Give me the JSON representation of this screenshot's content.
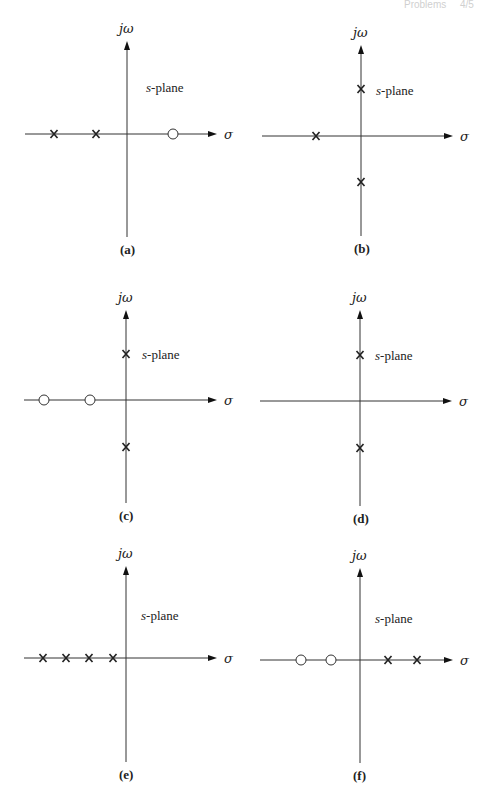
{
  "header": {
    "text": "Problems",
    "page": "4/5"
  },
  "axis_labels": {
    "imag": "jω",
    "real": "σ",
    "plane_italic": "s",
    "plane_rest": "-plane"
  },
  "panels": [
    {
      "id": "a",
      "label": "(a)",
      "origin": [
        127,
        134
      ],
      "hx": [
        25,
        217
      ],
      "vy": [
        41,
        237
      ],
      "plane_label_pos": [
        146,
        92
      ],
      "poles": [
        [
          54,
          134
        ],
        [
          96,
          134
        ]
      ],
      "zeros": [
        [
          173,
          134
        ]
      ]
    },
    {
      "id": "b",
      "label": "(b)",
      "origin": [
        361,
        136
      ],
      "hx": [
        262,
        453
      ],
      "vy": [
        45,
        236
      ],
      "plane_label_pos": [
        376,
        95
      ],
      "poles": [
        [
          361,
          89
        ],
        [
          316,
          136
        ],
        [
          361,
          182
        ]
      ],
      "zeros": []
    },
    {
      "id": "c",
      "label": "(c)",
      "origin": [
        126,
        400
      ],
      "hx": [
        24,
        217
      ],
      "vy": [
        310,
        503
      ],
      "plane_label_pos": [
        142,
        359
      ],
      "poles": [
        [
          126,
          354
        ],
        [
          126,
          447
        ]
      ],
      "zeros": [
        [
          44,
          400
        ],
        [
          90,
          400
        ]
      ]
    },
    {
      "id": "d",
      "label": "(d)",
      "origin": [
        360,
        401
      ],
      "hx": [
        260,
        452
      ],
      "vy": [
        310,
        506
      ],
      "plane_label_pos": [
        375,
        360
      ],
      "poles": [
        [
          360,
          355
        ],
        [
          360,
          448
        ]
      ],
      "zeros": []
    },
    {
      "id": "e",
      "label": "(e)",
      "origin": [
        126,
        658
      ],
      "hx": [
        24,
        217
      ],
      "vy": [
        566,
        762
      ],
      "plane_label_pos": [
        141,
        620
      ],
      "poles": [
        [
          43,
          658
        ],
        [
          66,
          658
        ],
        [
          89,
          658
        ],
        [
          113,
          658
        ]
      ],
      "zeros": []
    },
    {
      "id": "f",
      "label": "(f)",
      "origin": [
        360,
        660
      ],
      "hx": [
        260,
        453
      ],
      "vy": [
        568,
        763
      ],
      "plane_label_pos": [
        375,
        623
      ],
      "poles": [
        [
          388,
          660
        ],
        [
          417,
          660
        ]
      ],
      "zeros": [
        [
          301,
          660
        ],
        [
          331,
          660
        ]
      ]
    }
  ],
  "chart_data": [
    {
      "type": "scatter",
      "title": "(a)",
      "xlabel": "σ",
      "ylabel": "jω",
      "annotation": "s-plane",
      "poles": [
        {
          "re": -2,
          "im": 0
        },
        {
          "re": -1,
          "im": 0
        }
      ],
      "zeros": [
        {
          "re": 1,
          "im": 0
        }
      ]
    },
    {
      "type": "scatter",
      "title": "(b)",
      "xlabel": "σ",
      "ylabel": "jω",
      "annotation": "s-plane",
      "poles": [
        {
          "re": -1,
          "im": 0
        },
        {
          "re": 0,
          "im": 1
        },
        {
          "re": 0,
          "im": -1
        }
      ],
      "zeros": []
    },
    {
      "type": "scatter",
      "title": "(c)",
      "xlabel": "σ",
      "ylabel": "jω",
      "annotation": "s-plane",
      "poles": [
        {
          "re": 0,
          "im": 1
        },
        {
          "re": 0,
          "im": -1
        }
      ],
      "zeros": [
        {
          "re": -2,
          "im": 0
        },
        {
          "re": -1,
          "im": 0
        }
      ]
    },
    {
      "type": "scatter",
      "title": "(d)",
      "xlabel": "σ",
      "ylabel": "jω",
      "annotation": "s-plane",
      "poles": [
        {
          "re": 0,
          "im": 1
        },
        {
          "re": 0,
          "im": -1
        }
      ],
      "zeros": []
    },
    {
      "type": "scatter",
      "title": "(e)",
      "xlabel": "σ",
      "ylabel": "jω",
      "annotation": "s-plane",
      "poles": [
        {
          "re": -4,
          "im": 0
        },
        {
          "re": -3,
          "im": 0
        },
        {
          "re": -2,
          "im": 0
        },
        {
          "re": -1,
          "im": 0
        }
      ],
      "zeros": []
    },
    {
      "type": "scatter",
      "title": "(f)",
      "xlabel": "σ",
      "ylabel": "jω",
      "annotation": "s-plane",
      "poles": [
        {
          "re": 1,
          "im": 0
        },
        {
          "re": 2,
          "im": 0
        }
      ],
      "zeros": [
        {
          "re": -2,
          "im": 0
        },
        {
          "re": -1,
          "im": 0
        }
      ]
    }
  ]
}
